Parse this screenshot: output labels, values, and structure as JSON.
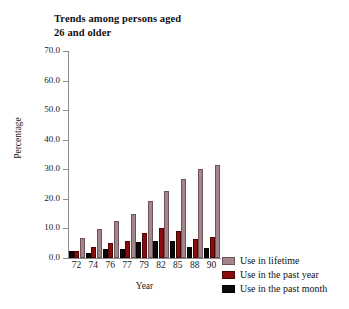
{
  "chart_data": {
    "type": "bar",
    "title": "Trends among persons aged 26 and older",
    "title_line1": "Trends among persons aged",
    "title_line2": "26 and older",
    "xlabel": "Year",
    "ylabel": "Percentage",
    "categories": [
      "72",
      "74",
      "76",
      "77",
      "79",
      "82",
      "85",
      "88",
      "90"
    ],
    "ylim": [
      0.0,
      70.0
    ],
    "yticks": [
      "0.0",
      "10.0",
      "20.0",
      "30.0",
      "40.0",
      "50.0",
      "60.0",
      "70.0"
    ],
    "ytick_values": [
      0.0,
      10.0,
      20.0,
      30.0,
      40.0,
      50.0,
      60.0,
      70.0
    ],
    "grid": false,
    "legend_position": "right-bottom",
    "series": [
      {
        "name": "Use in lifetime",
        "color": "#a3868b",
        "values": [
          6.9,
          9.9,
          12.4,
          15.0,
          19.3,
          22.5,
          26.8,
          30.2,
          31.5
        ]
      },
      {
        "name": "Use in the past year",
        "color": "#8b0c0c",
        "values": [
          2.4,
          3.8,
          5.2,
          5.9,
          8.5,
          10.2,
          9.1,
          6.5,
          7.0
        ]
      },
      {
        "name": "Use in the past month",
        "color": "#0a0a0a",
        "values": [
          2.3,
          1.8,
          3.2,
          2.9,
          5.4,
          5.6,
          5.6,
          3.6,
          3.3
        ]
      }
    ]
  }
}
